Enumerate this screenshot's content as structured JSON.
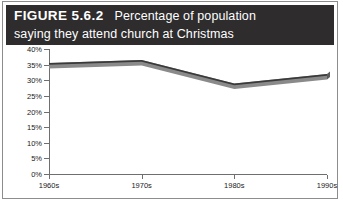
{
  "figure": {
    "label": "FIGURE 5.6.2",
    "caption_line_1": "Percentage of population",
    "caption_line_2": "saying they attend church at Christmas",
    "caption_full": "Percentage of population saying they attend church at Christmas"
  },
  "colors": {
    "title_bar_background": "#2e2c2d",
    "title_text": "#ffffff",
    "frame_border": "#8d8d8d",
    "axis": "#6f6f6f",
    "series_top_edge": "#3a3a3a",
    "series_body": "#8a8a8a",
    "series_side": "#5c5c5c",
    "page_background": "#ffffff"
  },
  "chart_data": {
    "type": "line",
    "title": "Percentage of population saying they attend church at Christmas",
    "xlabel": "",
    "ylabel": "",
    "categories": [
      "1960s",
      "1970s",
      "1980s",
      "1990s"
    ],
    "values": [
      35.5,
      36.5,
      29.0,
      32.0
    ],
    "series": [
      {
        "name": "Attend church at Christmas",
        "values": [
          35.5,
          36.5,
          29.0,
          32.0
        ]
      }
    ],
    "ylim": [
      0,
      40
    ],
    "yticks": [
      0,
      5,
      10,
      15,
      20,
      25,
      30,
      35,
      40
    ],
    "ytick_labels": [
      "0%",
      "5%",
      "10%",
      "15%",
      "20%",
      "25%",
      "30%",
      "35%",
      "40%"
    ],
    "xtick_labels": [
      "1960s",
      "1970s",
      "1980s",
      "1990s"
    ],
    "grid": false,
    "legend": false,
    "legend_position": "none",
    "style_note": "3d-ribbon-line"
  }
}
